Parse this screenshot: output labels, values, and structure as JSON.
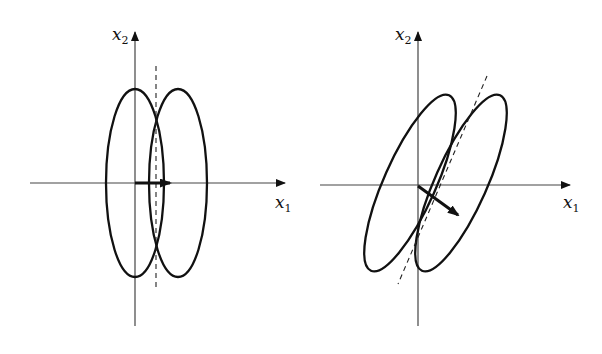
{
  "colors": {
    "ink": "#111111",
    "axis": "#333333",
    "background": "#ffffff"
  },
  "left_panel": {
    "x_axis_label": {
      "var": "x",
      "sub": "1"
    },
    "y_axis_label": {
      "var": "x",
      "sub": "2"
    },
    "description": "Two vertical ellipses side by side, dashed vertical line at their intersection, arrow along x1 axis"
  },
  "right_panel": {
    "x_axis_label": {
      "var": "x",
      "sub": "1"
    },
    "y_axis_label": {
      "var": "x",
      "sub": "2"
    },
    "description": "Two tilted ellipses side by side, dashed tilted line through their intersections, arrow pointing down-right"
  }
}
